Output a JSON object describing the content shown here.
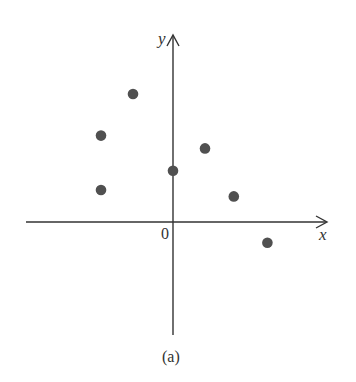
{
  "figure": {
    "caption": "(a)",
    "origin_label": "0",
    "x_axis_label": "x",
    "y_axis_label": "y"
  },
  "colors": {
    "axis": "#333333",
    "point": "#505050",
    "background": "#ffffff"
  },
  "chart_data": {
    "type": "scatter",
    "title": "",
    "caption": "(a)",
    "xlabel": "x",
    "ylabel": "y",
    "grid": false,
    "legend": null,
    "axis_ticks": false,
    "origin_label": "0",
    "note": "No tick marks or numeric scales shown; values are approximate relative positions (1 unit ≈ 32 px).",
    "xlim": [
      -4.6,
      4.8
    ],
    "ylim": [
      -3.6,
      5.8
    ],
    "points": [
      {
        "x": -2.25,
        "y": 1.0
      },
      {
        "x": -2.25,
        "y": 2.7
      },
      {
        "x": -1.25,
        "y": 4.0
      },
      {
        "x": 0.0,
        "y": 1.6
      },
      {
        "x": 1.0,
        "y": 2.3
      },
      {
        "x": 1.9,
        "y": 0.8
      },
      {
        "x": 2.95,
        "y": -0.65
      }
    ]
  }
}
